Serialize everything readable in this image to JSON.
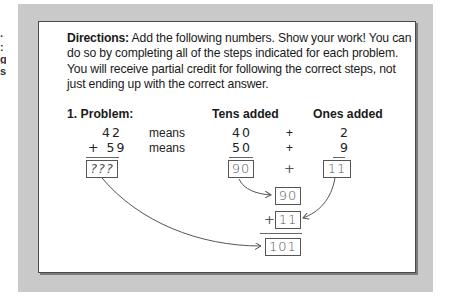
{
  "edge_fragments": [
    ".",
    ":",
    "g",
    "s"
  ],
  "directions": {
    "label": "Directions:",
    "text": " Add the following numbers. Show your work! You can do so by completing all of the steps indicated for each problem. You will receive partial credit for following the correct steps, not just ending up with the correct answer."
  },
  "problem": {
    "heading": "1.  Problem:",
    "tens_heading": "Tens added",
    "ones_heading": "Ones added",
    "rows": [
      {
        "operand": "42",
        "means": "means",
        "tens": "40",
        "plus": "+",
        "ones": "2"
      },
      {
        "operand": "+ 59",
        "means": "means",
        "tens": "50",
        "plus": "+",
        "ones": "9"
      }
    ],
    "answer_placeholder": "???",
    "tens_sum": "90",
    "ones_sum": "11",
    "sum_plus": "+",
    "combine": {
      "top": "90",
      "plus": "+",
      "bottom": "11",
      "result": "101"
    }
  },
  "colors": {
    "frame": "#c9c9c9",
    "card": "#ffffff",
    "ink": "#555555"
  }
}
